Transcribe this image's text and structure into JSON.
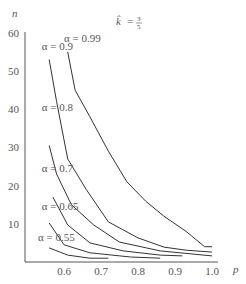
{
  "chart_data": {
    "type": "line",
    "title_parts": {
      "lhs": "k̂",
      "num": "3",
      "den": "5"
    },
    "xlabel": "p",
    "ylabel": "n",
    "xlim": [
      0.5,
      1.0
    ],
    "ylim": [
      0,
      60
    ],
    "xticks": [
      0.6,
      0.7,
      0.8,
      0.9,
      1.0
    ],
    "xtick_labels": [
      "0.6",
      "0.7",
      "0.8",
      "0.9",
      "1.0"
    ],
    "yticks": [
      10,
      20,
      30,
      40,
      50,
      60
    ],
    "ytick_labels": [
      "10",
      "20",
      "30",
      "40",
      "50",
      "60"
    ],
    "grid": false,
    "legend": "inline labels",
    "series": [
      {
        "name": "α = 0.99",
        "label_pos": [
          0.6,
          57.5
        ],
        "x": [
          0.61,
          0.63,
          0.67,
          0.72,
          0.77,
          0.82,
          0.87,
          0.93,
          0.98,
          1.0
        ],
        "y": [
          55,
          45,
          38,
          29,
          21,
          16,
          12,
          8,
          4,
          4
        ]
      },
      {
        "name": "α = 0.9",
        "label_pos": [
          0.54,
          55.5
        ],
        "x": [
          0.56,
          0.58,
          0.61,
          0.66,
          0.72,
          0.8,
          0.87,
          0.93,
          1.0
        ],
        "y": [
          53,
          42,
          27,
          19,
          10.5,
          6.3,
          3.9,
          3.1,
          2.6
        ]
      },
      {
        "name": "α = 0.8",
        "label_pos": [
          0.54,
          39.5
        ],
        "x": [
          0.56,
          0.58,
          0.62,
          0.68,
          0.75,
          0.86,
          1.0
        ],
        "y": [
          30.5,
          23,
          15,
          9.7,
          5.2,
          2.9,
          1.6
        ]
      },
      {
        "name": "α = 0.7",
        "label_pos": [
          0.54,
          23.5
        ],
        "x": [
          0.57,
          0.61,
          0.67,
          0.76,
          0.86,
          0.92
        ],
        "y": [
          17,
          9.7,
          5,
          2.9,
          1.8,
          1.6
        ]
      },
      {
        "name": "α = 0.65",
        "label_pos": [
          0.54,
          13.5
        ],
        "x": [
          0.56,
          0.6,
          0.67,
          0.78,
          0.86
        ],
        "y": [
          10.2,
          4.5,
          2.4,
          1.3,
          1.0
        ]
      },
      {
        "name": "α = 0.55",
        "label_pos": [
          0.53,
          5.5
        ],
        "x": [
          0.56,
          0.61,
          0.67,
          0.72
        ],
        "y": [
          3.7,
          1.8,
          1.0,
          1.0
        ]
      }
    ]
  }
}
